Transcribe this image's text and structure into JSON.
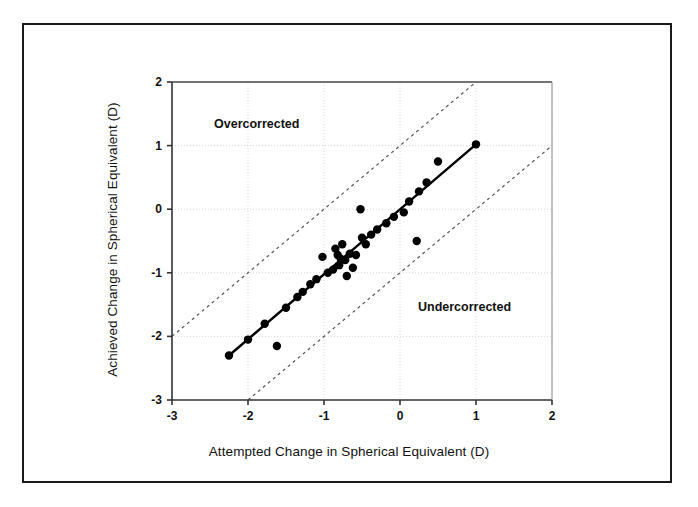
{
  "figure": {
    "x_axis_title": "Attempted Change in Spherical Equivalent (D)",
    "y_axis_title": "Achieved Change in Spherical Equivalent (D)",
    "region_overcorrected": "Overcorrected",
    "region_undercorrected": "Undercorrected",
    "frame_color": "#1a1a1a",
    "marker_color": "#000000",
    "fit_line_color": "#000000",
    "bound_line_color": "#555555",
    "grid_color": "#d9d9d9"
  },
  "xticks": [
    "-3",
    "-2",
    "-1",
    "0",
    "1",
    "2"
  ],
  "yticks": [
    "2",
    "1",
    "0",
    "-1",
    "-2",
    "-3"
  ],
  "chart_data": {
    "type": "scatter",
    "title": "",
    "xlabel": "Attempted Change in Spherical Equivalent (D)",
    "ylabel": "Achieved Change in Spherical Equivalent (D)",
    "xlim": [
      -3,
      2
    ],
    "ylim": [
      -3,
      2
    ],
    "xticks": [
      -3,
      -2,
      -1,
      0,
      1,
      2
    ],
    "yticks": [
      -3,
      -2,
      -1,
      0,
      1,
      2
    ],
    "grid": true,
    "legend": "none",
    "annotations": [
      {
        "text": "Overcorrected",
        "x": -2.43,
        "y": 1.22
      },
      {
        "text": "Undercorrected",
        "x": 0.26,
        "y": -1.65
      }
    ],
    "series": [
      {
        "name": "Eyes",
        "type": "scatter",
        "marker": "filled-circle",
        "points": [
          [
            -2.25,
            -2.3
          ],
          [
            -2.0,
            -2.05
          ],
          [
            -1.78,
            -1.8
          ],
          [
            -1.62,
            -2.15
          ],
          [
            -1.5,
            -1.55
          ],
          [
            -1.35,
            -1.38
          ],
          [
            -1.28,
            -1.3
          ],
          [
            -1.18,
            -1.18
          ],
          [
            -1.1,
            -1.1
          ],
          [
            -1.02,
            -0.75
          ],
          [
            -0.95,
            -1.0
          ],
          [
            -0.88,
            -0.95
          ],
          [
            -0.85,
            -0.62
          ],
          [
            -0.82,
            -0.72
          ],
          [
            -0.8,
            -0.88
          ],
          [
            -0.78,
            -0.78
          ],
          [
            -0.76,
            -0.55
          ],
          [
            -0.72,
            -0.8
          ],
          [
            -0.7,
            -1.05
          ],
          [
            -0.66,
            -0.7
          ],
          [
            -0.62,
            -0.92
          ],
          [
            -0.58,
            -0.72
          ],
          [
            -0.52,
            0.0
          ],
          [
            -0.5,
            -0.45
          ],
          [
            -0.45,
            -0.55
          ],
          [
            -0.38,
            -0.4
          ],
          [
            -0.3,
            -0.32
          ],
          [
            -0.18,
            -0.22
          ],
          [
            -0.08,
            -0.12
          ],
          [
            0.05,
            -0.05
          ],
          [
            0.12,
            0.12
          ],
          [
            0.22,
            -0.5
          ],
          [
            0.25,
            0.28
          ],
          [
            0.35,
            0.42
          ],
          [
            0.5,
            0.75
          ],
          [
            1.0,
            1.02
          ]
        ]
      },
      {
        "name": "Regression line",
        "type": "line",
        "style": "solid",
        "points": [
          [
            -2.25,
            -2.3
          ],
          [
            1.0,
            1.02
          ]
        ]
      },
      {
        "name": "Upper 1D bound",
        "type": "line",
        "style": "dotted",
        "points": [
          [
            -3.0,
            -2.0
          ],
          [
            1.0,
            2.0
          ]
        ]
      },
      {
        "name": "Lower 1D bound",
        "type": "line",
        "style": "dotted",
        "points": [
          [
            -2.0,
            -3.0
          ],
          [
            2.0,
            1.0
          ]
        ]
      }
    ]
  }
}
